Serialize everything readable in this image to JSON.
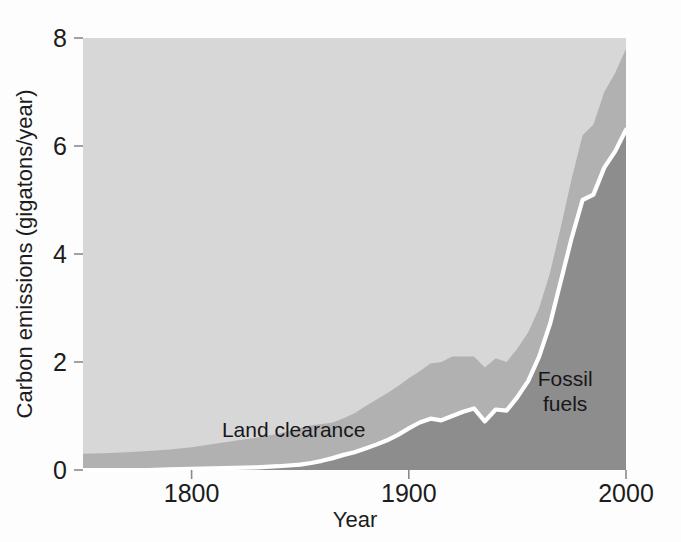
{
  "chart_data": {
    "type": "area",
    "stacked": true,
    "title": "",
    "subtitle": "",
    "xlabel": "Year",
    "ylabel": "Carbon emissions (gigatons/year)",
    "xlim": [
      1750,
      2000
    ],
    "ylim": [
      0,
      8
    ],
    "xticks": [
      1800,
      1900,
      2000
    ],
    "xtick_labels": [
      "1800",
      "1900",
      "2000"
    ],
    "yticks": [
      0,
      2,
      4,
      6,
      8
    ],
    "ytick_labels": [
      "0",
      "2",
      "4",
      "6",
      "8"
    ],
    "grid": false,
    "legend_position": "inline-annotations",
    "annotations": [
      {
        "text": "Land clearance",
        "x": 1847,
        "y": 0.62
      },
      {
        "text": "Fossil",
        "x": 1972,
        "y": 1.55
      },
      {
        "text": "fuels",
        "x": 1972,
        "y": 1.1
      }
    ],
    "colors": {
      "plot_background": "#d7d7d7",
      "land_clearance": "#b1b1b1",
      "fossil_fuels": "#8d8d8d",
      "divider_line": "#ffffff",
      "text": "#1c1c1c"
    },
    "x": [
      1750,
      1760,
      1770,
      1780,
      1790,
      1800,
      1810,
      1820,
      1830,
      1840,
      1850,
      1855,
      1860,
      1865,
      1870,
      1875,
      1880,
      1885,
      1890,
      1895,
      1900,
      1905,
      1910,
      1915,
      1920,
      1925,
      1930,
      1935,
      1940,
      1945,
      1950,
      1955,
      1960,
      1965,
      1970,
      1975,
      1980,
      1985,
      1990,
      1995,
      2000
    ],
    "series": [
      {
        "name": "Fossil fuels",
        "note": "white boundary line; lower band of the stack",
        "values": [
          0.0,
          0.0,
          0.0,
          0.0,
          0.01,
          0.02,
          0.03,
          0.04,
          0.05,
          0.07,
          0.1,
          0.13,
          0.17,
          0.22,
          0.28,
          0.33,
          0.4,
          0.47,
          0.55,
          0.65,
          0.77,
          0.88,
          0.95,
          0.92,
          1.0,
          1.08,
          1.14,
          0.9,
          1.12,
          1.1,
          1.35,
          1.65,
          2.1,
          2.7,
          3.5,
          4.3,
          5.0,
          5.1,
          5.6,
          5.9,
          6.3
        ]
      },
      {
        "name": "Land clearance",
        "note": "upper band; total minus fossil fuels",
        "values": [
          0.3,
          0.31,
          0.33,
          0.35,
          0.37,
          0.4,
          0.45,
          0.5,
          0.55,
          0.6,
          0.68,
          0.7,
          0.68,
          0.66,
          0.68,
          0.72,
          0.78,
          0.83,
          0.87,
          0.9,
          0.93,
          0.95,
          1.02,
          1.08,
          1.1,
          1.02,
          0.96,
          1.0,
          0.95,
          0.9,
          0.9,
          0.9,
          0.9,
          0.95,
          1.0,
          1.1,
          1.2,
          1.3,
          1.4,
          1.45,
          1.5
        ]
      }
    ],
    "total": [
      0.3,
      0.31,
      0.33,
      0.35,
      0.38,
      0.42,
      0.48,
      0.54,
      0.6,
      0.67,
      0.78,
      0.83,
      0.85,
      0.88,
      0.96,
      1.05,
      1.18,
      1.3,
      1.42,
      1.55,
      1.7,
      1.83,
      1.97,
      2.0,
      2.1,
      2.1,
      2.1,
      1.9,
      2.07,
      2.0,
      2.25,
      2.55,
      3.0,
      3.65,
      4.5,
      5.4,
      6.2,
      6.4,
      7.0,
      7.35,
      7.8
    ]
  },
  "axes": {
    "y_title": "Carbon emissions (gigatons/year)",
    "x_title": "Year"
  }
}
